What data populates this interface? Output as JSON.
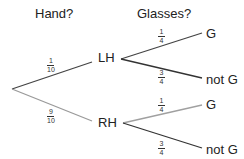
{
  "headers": {
    "stage1": "Hand?",
    "stage2": "Glasses?"
  },
  "nodes": {
    "lh": "LH",
    "rh": "RH",
    "lh_g": "G",
    "lh_notg": "not G",
    "rh_g": "G",
    "rh_notg": "not G"
  },
  "branches": {
    "root_lh": {
      "num": "1",
      "den": "10",
      "color": "#444444"
    },
    "root_rh": {
      "num": "9",
      "den": "10",
      "color": "#9a9a9a"
    },
    "lh_g": {
      "num": "1",
      "den": "4",
      "color": "#444444"
    },
    "lh_notg": {
      "num": "3",
      "den": "4",
      "color": "#333333"
    },
    "rh_g": {
      "num": "1",
      "den": "4",
      "color": "#a0a0a0"
    },
    "rh_notg": {
      "num": "3",
      "den": "4",
      "color": "#333333"
    }
  }
}
